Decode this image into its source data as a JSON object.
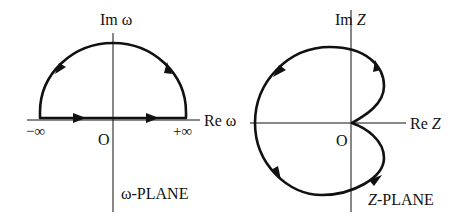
{
  "left_diagram": {
    "name": "omega-plane",
    "axis_labels": {
      "imaginary": "Im ω",
      "real": "Re ω"
    },
    "origin_label": "O",
    "minus_infinity_label": "−∞",
    "plus_infinity_label": "+∞",
    "plane_label": "ω-PLANE",
    "contour": "closed semicircular contour in upper half plane: along real axis from −∞ to +∞ (two rightward arrows), then counterclockwise along large semicircle back to −∞ (arrows on arc)"
  },
  "right_diagram": {
    "name": "z-plane",
    "axis_labels": {
      "imaginary_prefix": "Im ",
      "imaginary_var": "Z",
      "real_prefix": "Re ",
      "real_var": "Z"
    },
    "origin_label": "O",
    "plane_label_var": "Z",
    "plane_label_suffix": "-PLANE",
    "contour": "cardioid-like closed curve with cusp at origin, traversed counterclockwise (arrows at upper-right lobe, upper-left, lower-left, lower-right lobe)"
  },
  "colors": {
    "stroke": "#111111",
    "background": "#ffffff"
  }
}
